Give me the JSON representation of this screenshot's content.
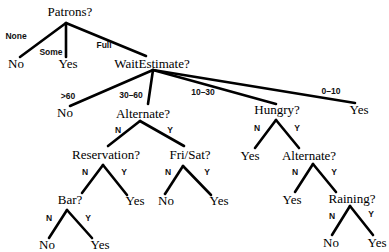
{
  "nodes": {
    "patrons": "Patrons?",
    "patrons_none_leaf": "No",
    "patrons_some_leaf": "Yes",
    "wait_estimate": "WaitEstimate?",
    "wait_gt60_leaf": "No",
    "alternate1": "Alternate?",
    "hungry": "Hungry?",
    "wait_0_10_leaf": "Yes",
    "reservation": "Reservation?",
    "fri_sat": "Fri/Sat?",
    "reservation_yes_leaf": "Yes",
    "bar": "Bar?",
    "bar_no_leaf": "No",
    "bar_yes_leaf": "Yes",
    "frisat_no_leaf": "No",
    "frisat_yes_leaf": "Yes",
    "hungry_no_leaf": "Yes",
    "alternate2": "Alternate?",
    "alternate2_no_leaf": "Yes",
    "raining": "Raining?",
    "raining_no_leaf": "No",
    "raining_yes_leaf": "Yes"
  },
  "edges": {
    "none": "None",
    "some": "Some",
    "full": "Full",
    "gt60": ">60",
    "r30_60": "30–60",
    "r10_30": "10–30",
    "r0_10": "0–10",
    "n": "N",
    "y": "Y"
  }
}
